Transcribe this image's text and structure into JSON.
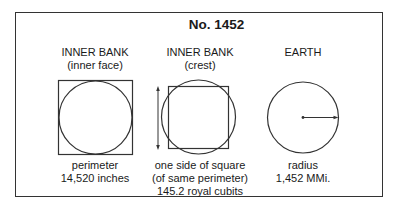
{
  "title": "No. 1452",
  "panels": [
    {
      "heading": "INNER BANK",
      "subheading": "(inner face)",
      "figure": "square-with-inscribed-circle",
      "caption_lines": [
        "perimeter",
        "14,520 inches"
      ]
    },
    {
      "heading": "INNER BANK",
      "subheading": "(crest)",
      "figure": "square-and-circle-of-equal-perimeter",
      "caption_lines": [
        "one side of square",
        "(of same perimeter)",
        "145.2 royal cubits"
      ]
    },
    {
      "heading": "EARTH",
      "subheading": "",
      "figure": "circle-with-radius-arrow",
      "caption_lines": [
        "radius",
        "1,452 MMi."
      ]
    }
  ],
  "colors": {
    "stroke": "#333333",
    "text": "#1a1a1a",
    "background": "#ffffff"
  }
}
